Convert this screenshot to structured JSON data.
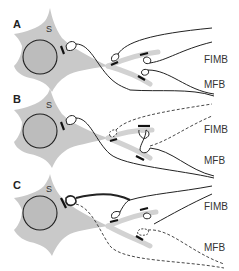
{
  "figure": {
    "panels": [
      {
        "id": "A",
        "letter": "A",
        "soma_label": "S",
        "tract_labels": {
          "upper": "FIMB",
          "lower": "MFB"
        },
        "description": "Neuron soma with intact fimbrial (FIMB) and medial forebrain bundle (MFB) afferents forming synapses on soma and dendrites"
      },
      {
        "id": "B",
        "letter": "B",
        "soma_label": "S",
        "tract_labels": {
          "upper": "FIMB",
          "lower": "MFB"
        },
        "description": "FIMB afferents degenerating (dashed); MFB terminal sprouting to occupy vacated site"
      },
      {
        "id": "C",
        "letter": "C",
        "soma_label": "S",
        "tract_labels": {
          "upper": "FIMB",
          "lower": "MFB"
        },
        "description": "MFB afferents degenerated (dashed); FIMB afferents with thickened terminal on soma"
      }
    ],
    "legend_conventions": {
      "solid_line": "intact axon",
      "dashed_line": "degenerating axon",
      "thick_bar": "synaptic contact"
    },
    "colors": {
      "cell_fill": "#c9c9c9",
      "nucleus_fill": "#bcbcbc",
      "line": "#222222",
      "background": "#ffffff"
    }
  }
}
